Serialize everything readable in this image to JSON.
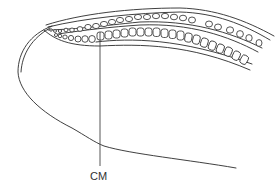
{
  "figure": {
    "type": "anatomical-diagram",
    "line_color": "#2a2a2a",
    "background": "#ffffff"
  },
  "labels": [
    {
      "id": "cm",
      "text": "CM",
      "x": 90,
      "y": 172
    }
  ],
  "leader_lines": [
    {
      "label": "CM",
      "x": 100,
      "y1": 32,
      "y2": 166
    }
  ],
  "cell_rows": [
    {
      "name": "upper-cell-row",
      "count": 24,
      "shape": "oval"
    },
    {
      "name": "lower-cell-row",
      "count": 22,
      "shape": "rounded-square"
    }
  ]
}
